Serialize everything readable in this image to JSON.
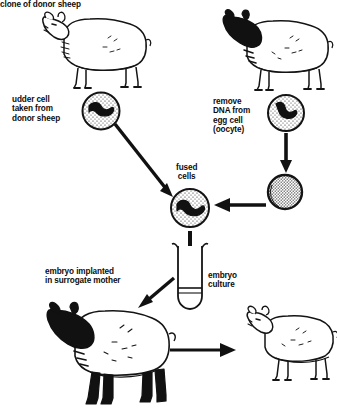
{
  "diagram": {
    "background_color": "#ffffff",
    "ink_color": "#0d0d0d",
    "width": 337,
    "height": 413,
    "style": "black-and-white line drawing"
  },
  "labels": {
    "udder_cell": "udder cell\ntaken from\ndonor sheep",
    "remove_dna": "remove\nDNA from\negg cell\n(oocyte)",
    "fused_cells": "fused\ncells",
    "embryo_implanted": "embryo implanted\nin surrogate mother",
    "embryo_culture": "embryo\nculture",
    "clone_of_donor": "clone of donor sheep"
  },
  "figures": [
    {
      "name": "donor-sheep",
      "label": "donor sheep",
      "head_color": "white",
      "legs_color": "white",
      "facing": "left"
    },
    {
      "name": "egg-donor-sheep",
      "label": "egg donor sheep",
      "head_color": "black",
      "legs_color": "white",
      "facing": "left"
    },
    {
      "name": "surrogate-mother-sheep",
      "label": "surrogate mother",
      "head_color": "black",
      "legs_color": "black",
      "facing": "left"
    },
    {
      "name": "clone-lamb",
      "label": "clone of donor sheep",
      "head_color": "white",
      "legs_color": "white",
      "facing": "left"
    }
  ],
  "cells": [
    {
      "name": "udder-cell",
      "type": "stippled circle with nucleus",
      "has_nucleus": true
    },
    {
      "name": "oocyte-cell",
      "type": "stippled circle with nucleus",
      "has_nucleus": true
    },
    {
      "name": "enucleated-egg",
      "type": "solid stippled ball",
      "has_nucleus": false
    },
    {
      "name": "fused-cell",
      "type": "stippled circle with nucleus",
      "has_nucleus": true
    }
  ],
  "apparatus": {
    "test_tube": {
      "name": "embryo-culture-test-tube",
      "contents": "culture medium"
    }
  },
  "arrows": [
    {
      "name": "arrow-udder-to-fused",
      "from": "udder-cell",
      "to": "fused-cell",
      "direction": "down-right"
    },
    {
      "name": "arrow-oocyte-to-enucleated",
      "from": "oocyte-cell",
      "to": "enucleated-egg",
      "direction": "down"
    },
    {
      "name": "arrow-enucleated-to-fused",
      "from": "enucleated-egg",
      "to": "fused-cell",
      "direction": "left"
    },
    {
      "name": "arrow-fused-to-tube",
      "from": "fused-cell",
      "to": "embryo-culture-test-tube",
      "direction": "down"
    },
    {
      "name": "arrow-tube-to-surrogate",
      "from": "embryo-culture-test-tube",
      "to": "surrogate-mother-sheep",
      "direction": "down-left"
    },
    {
      "name": "arrow-surrogate-to-clone",
      "from": "surrogate-mother-sheep",
      "to": "clone-lamb",
      "direction": "right"
    }
  ]
}
